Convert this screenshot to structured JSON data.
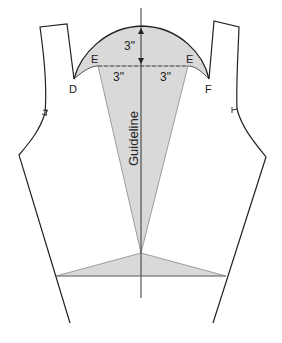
{
  "diagram": {
    "type": "sewing-pattern-bodice-front",
    "labels": {
      "point_d": "D",
      "point_f": "F",
      "point_e_left": "E",
      "point_e_right": "E",
      "guideline": "Guideline",
      "vertical_measure": "3\"",
      "left_measure": "3\"",
      "right_measure": "3\""
    },
    "colors": {
      "outline": "#222222",
      "fill_shaded": "#d9d9d9",
      "dashed": "#555555",
      "background": "#ffffff"
    }
  }
}
